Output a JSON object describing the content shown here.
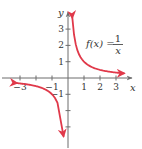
{
  "chart_data": {
    "type": "line",
    "title": "",
    "function_label": {
      "lhs": "f(x) =",
      "numerator": "1",
      "denominator": "x"
    },
    "xlabel": "x",
    "ylabel": "y",
    "xlim": [
      -3.4,
      3.9
    ],
    "ylim": [
      -4.2,
      4.0
    ],
    "x_ticks": [
      -3,
      -2,
      -1,
      1,
      2,
      3
    ],
    "x_tick_labels": [
      "-3",
      "",
      "-1",
      "1",
      "2",
      "3"
    ],
    "y_ticks": [
      -3,
      -2,
      -1,
      1,
      2,
      3
    ],
    "y_tick_labels": [
      "",
      "",
      "-1",
      "1",
      "2",
      "3"
    ],
    "grid": false,
    "legend": null,
    "series": [
      {
        "name": "f(x) = 1/x (x > 0)",
        "color": "#e0394a",
        "x": [
          0.27,
          0.3,
          0.35,
          0.4,
          0.5,
          0.6,
          0.75,
          1,
          1.25,
          1.5,
          2,
          2.5,
          3,
          3.5
        ],
        "y": [
          3.7,
          3.33,
          2.86,
          2.5,
          2,
          1.67,
          1.33,
          1,
          0.8,
          0.67,
          0.5,
          0.4,
          0.33,
          0.29
        ]
      },
      {
        "name": "f(x) = 1/x (x < 0)",
        "color": "#e0394a",
        "x": [
          -3.2,
          -3,
          -2.5,
          -2,
          -1.5,
          -1.25,
          -1,
          -0.75,
          -0.6,
          -0.5,
          -0.4,
          -0.33,
          -0.28
        ],
        "y": [
          -0.31,
          -0.33,
          -0.4,
          -0.5,
          -0.67,
          -0.8,
          -1,
          -1.33,
          -1.67,
          -2,
          -2.5,
          -3.03,
          -3.57
        ]
      }
    ]
  }
}
